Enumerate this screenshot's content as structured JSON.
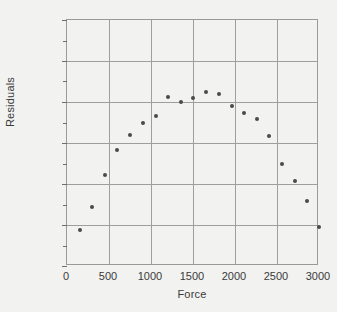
{
  "chart_data": {
    "type": "scatter",
    "title": "",
    "xlabel": "Force",
    "ylabel": "Residuals",
    "xlim": [
      0,
      3000
    ],
    "ylim": [
      -0.006,
      0.006
    ],
    "grid": true,
    "legend": false,
    "legend_position": "none",
    "marker_color": "#4a4a4a",
    "background_color": "#f2f2f0",
    "gridline_color": "#9e9e9e",
    "axis_color": "#9a9a9a",
    "text_color": "#3a3a3a",
    "xticks": [
      0,
      500,
      1000,
      1500,
      2000,
      2500,
      3000
    ],
    "xticklabels": [
      "0",
      "500",
      "1000",
      "1500",
      "2000",
      "2500",
      "3000"
    ],
    "yticks": [
      -0.006,
      -0.004,
      -0.002,
      0,
      0.002,
      0.004,
      0.006
    ],
    "yticklabels": [
      "-0.006",
      "-0.004",
      "-0.002",
      "0",
      "0.002",
      "0.004",
      "0.006"
    ],
    "y_minor_ticks": [
      -0.005,
      -0.003,
      -0.001,
      0.001,
      0.003,
      0.005
    ],
    "x": [
      150,
      300,
      450,
      600,
      755,
      900,
      1060,
      1205,
      1355,
      1505,
      1660,
      1810,
      1960,
      2110,
      2260,
      2410,
      2560,
      2710,
      2860,
      3000
    ],
    "y": [
      -0.00422,
      -0.00312,
      -0.00155,
      -0.00035,
      0.00038,
      0.001,
      0.00132,
      0.00225,
      0.00198,
      0.0022,
      0.00247,
      0.00237,
      0.0018,
      0.00148,
      0.00118,
      0.00033,
      -0.001,
      -0.00185,
      -0.00283,
      -0.0041
    ],
    "points": [
      {
        "x": 150,
        "y": -0.00422
      },
      {
        "x": 300,
        "y": -0.00312
      },
      {
        "x": 450,
        "y": -0.00155
      },
      {
        "x": 600,
        "y": -0.00035
      },
      {
        "x": 755,
        "y": 0.00038
      },
      {
        "x": 900,
        "y": 0.001
      },
      {
        "x": 1060,
        "y": 0.00132
      },
      {
        "x": 1205,
        "y": 0.00225
      },
      {
        "x": 1355,
        "y": 0.00198
      },
      {
        "x": 1505,
        "y": 0.0022
      },
      {
        "x": 1660,
        "y": 0.00247
      },
      {
        "x": 1810,
        "y": 0.00237
      },
      {
        "x": 1960,
        "y": 0.0018
      },
      {
        "x": 2110,
        "y": 0.00148
      },
      {
        "x": 2260,
        "y": 0.00118
      },
      {
        "x": 2410,
        "y": 0.00033
      },
      {
        "x": 2560,
        "y": -0.001
      },
      {
        "x": 2710,
        "y": -0.00185
      },
      {
        "x": 2860,
        "y": -0.00283
      },
      {
        "x": 3000,
        "y": -0.0041
      }
    ]
  }
}
